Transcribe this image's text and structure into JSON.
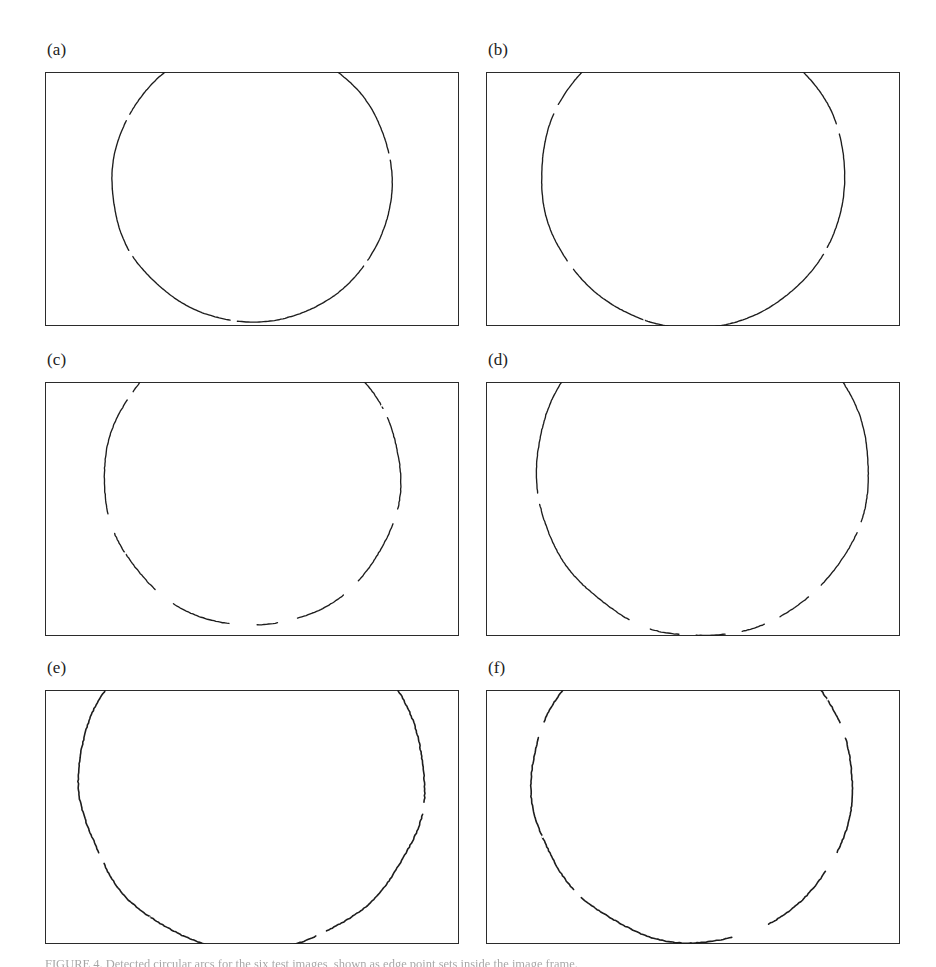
{
  "figure": {
    "kind": "multi-panel scanned figure",
    "panel_count": 6,
    "background_color": "#ffffff",
    "frame_color": "#2b2b2b",
    "curve_color": "#1d1d1d",
    "caption_text": "FIGURE 4. Detected circular arcs for the six test images, shown as edge point sets inside the image frame."
  },
  "panels": [
    {
      "id": "a",
      "label": "(a)",
      "column": "left",
      "row": 1,
      "description": "nearly complete smooth circular arc, few small gaps"
    },
    {
      "id": "b",
      "label": "(b)",
      "column": "right",
      "row": 1,
      "description": "wide smooth circular arc, small gaps near the ends"
    },
    {
      "id": "c",
      "label": "(c)",
      "column": "left",
      "row": 2,
      "description": "fragmented arc with a large gap at the bottom centre"
    },
    {
      "id": "d",
      "label": "(d)",
      "column": "right",
      "row": 2,
      "description": "asymmetric arc shifted right, detached segment at top right, dashed bottom"
    },
    {
      "id": "e",
      "label": "(e)",
      "column": "left",
      "row": 3,
      "description": "noisy jagged arc spanning nearly the full panel width"
    },
    {
      "id": "f",
      "label": "(f)",
      "column": "right",
      "row": 3,
      "description": "noisy arc with a pronounced gap at the bottom right"
    }
  ],
  "chart_data": {
    "type": "scatter",
    "title": "",
    "xlabel": "",
    "ylabel": "",
    "grid": false,
    "legend": null,
    "xlim": [
      0,
      414
    ],
    "ylim": [
      0,
      254
    ],
    "note": "Each panel plots a set of detected edge pixels lying on a circular arc; coordinates are in panel pixel units with y measured downward from the panel top.",
    "series": [
      {
        "name": "(a)",
        "panel": "a",
        "circle": {
          "cx": 207,
          "cy": 110,
          "r": 140
        },
        "angle_span_deg": [
          -75,
          255
        ],
        "noise_amplitude_px": 0.6,
        "gap_count": 5,
        "segments": [
          {
            "start_deg": -72,
            "end_deg": -12
          },
          {
            "start_deg": -9,
            "end_deg": 34
          },
          {
            "start_deg": 37,
            "end_deg": 96
          },
          {
            "start_deg": 99,
            "end_deg": 148
          },
          {
            "start_deg": 151,
            "end_deg": 206
          },
          {
            "start_deg": 209,
            "end_deg": 252
          }
        ]
      },
      {
        "name": "(b)",
        "panel": "b",
        "circle": {
          "cx": 207,
          "cy": 104,
          "r": 152
        },
        "angle_span_deg": [
          -70,
          250
        ],
        "noise_amplitude_px": 0.6,
        "gap_count": 5,
        "segments": [
          {
            "start_deg": -70,
            "end_deg": -20
          },
          {
            "start_deg": -16,
            "end_deg": 28
          },
          {
            "start_deg": 31,
            "end_deg": 90
          },
          {
            "start_deg": 94,
            "end_deg": 142
          },
          {
            "start_deg": 146,
            "end_deg": 204
          },
          {
            "start_deg": 208,
            "end_deg": 248
          }
        ]
      },
      {
        "name": "(c)",
        "panel": "c",
        "circle": {
          "cx": 207,
          "cy": 96,
          "r": 148
        },
        "angle_span_deg": [
          -72,
          252
        ],
        "noise_amplitude_px": 1.1,
        "gap_count": 8,
        "segments": [
          {
            "start_deg": -72,
            "end_deg": -28
          },
          {
            "start_deg": -24,
            "end_deg": 12
          },
          {
            "start_deg": 18,
            "end_deg": 44
          },
          {
            "start_deg": 52,
            "end_deg": 72
          },
          {
            "start_deg": 80,
            "end_deg": 88
          },
          {
            "start_deg": 99,
            "end_deg": 122
          },
          {
            "start_deg": 131,
            "end_deg": 158
          },
          {
            "start_deg": 166,
            "end_deg": 212
          },
          {
            "start_deg": 216,
            "end_deg": 250
          }
        ]
      },
      {
        "name": "(d)",
        "panel": "d",
        "circle": {
          "cx": 216,
          "cy": 88,
          "r": 166
        },
        "angle_span_deg": [
          -78,
          238
        ],
        "noise_amplitude_px": 1.0,
        "gap_count": 9,
        "segments": [
          {
            "start_deg": -78,
            "end_deg": -44
          },
          {
            "start_deg": -34,
            "end_deg": 18
          },
          {
            "start_deg": 22,
            "end_deg": 44
          },
          {
            "start_deg": 50,
            "end_deg": 62
          },
          {
            "start_deg": 68,
            "end_deg": 76
          },
          {
            "start_deg": 82,
            "end_deg": 92
          },
          {
            "start_deg": 98,
            "end_deg": 108
          },
          {
            "start_deg": 116,
            "end_deg": 168
          },
          {
            "start_deg": 172,
            "end_deg": 236
          }
        ]
      },
      {
        "name": "(e)",
        "panel": "e",
        "circle": {
          "cx": 207,
          "cy": 88,
          "r": 172
        },
        "angle_span_deg": [
          -76,
          250
        ],
        "noise_amplitude_px": 1.8,
        "gap_count": 4,
        "segments": [
          {
            "start_deg": -76,
            "end_deg": 8
          },
          {
            "start_deg": 12,
            "end_deg": 64
          },
          {
            "start_deg": 68,
            "end_deg": 150
          },
          {
            "start_deg": 154,
            "end_deg": 222
          },
          {
            "start_deg": 228,
            "end_deg": 246
          }
        ]
      },
      {
        "name": "(f)",
        "panel": "f",
        "circle": {
          "cx": 207,
          "cy": 92,
          "r": 160
        },
        "angle_span_deg": [
          -74,
          248
        ],
        "noise_amplitude_px": 1.6,
        "gap_count": 6,
        "segments": [
          {
            "start_deg": -74,
            "end_deg": -22
          },
          {
            "start_deg": -16,
            "end_deg": 26
          },
          {
            "start_deg": 34,
            "end_deg": 62
          },
          {
            "start_deg": 76,
            "end_deg": 134
          },
          {
            "start_deg": 138,
            "end_deg": 196
          },
          {
            "start_deg": 202,
            "end_deg": 246
          }
        ]
      }
    ]
  }
}
